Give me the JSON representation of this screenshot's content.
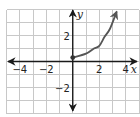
{
  "chart_data": {
    "type": "line",
    "title": "",
    "xlabel": "x",
    "ylabel": "y",
    "xlim": [
      -5,
      5
    ],
    "ylim": [
      -4,
      4
    ],
    "grid": true,
    "grid_step": 1,
    "x_ticks": [
      {
        "value": -4,
        "label": "−4"
      },
      {
        "value": -2,
        "label": "−2"
      },
      {
        "value": 2,
        "label": "2"
      },
      {
        "value": 4,
        "label": "4"
      }
    ],
    "y_ticks": [
      {
        "value": 2,
        "label": "2"
      },
      {
        "value": -2,
        "label": "−2"
      }
    ],
    "series": [
      {
        "name": "f(x)",
        "color": "#555555",
        "start_point": "closed-dot",
        "end": "arrow",
        "points": [
          {
            "x": 0,
            "y": 0.3
          },
          {
            "x": 1,
            "y": 0.6
          },
          {
            "x": 1.6,
            "y": 1.0
          },
          {
            "x": 2,
            "y": 1.2
          },
          {
            "x": 2.4,
            "y": 1.9
          },
          {
            "x": 2.8,
            "y": 2.5
          },
          {
            "x": 3.3,
            "y": 3.8
          }
        ]
      }
    ]
  },
  "labels": {
    "x_axis": "x",
    "y_axis": "y"
  }
}
